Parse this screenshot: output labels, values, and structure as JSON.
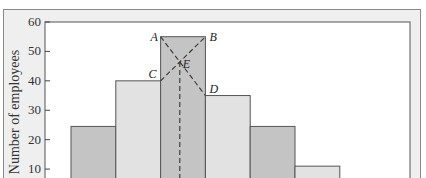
{
  "chart_data": {
    "type": "bar",
    "title": "",
    "xlabel": "",
    "ylabel": "Number of employees",
    "ylim": [
      0,
      60
    ],
    "yticks": [
      10,
      20,
      30,
      40,
      50,
      60
    ],
    "categories": [
      "class 1",
      "class 2",
      "class 3 (modal)",
      "class 4",
      "class 5",
      "class 6"
    ],
    "values": [
      24.5,
      40,
      55,
      35,
      24.5,
      11
    ],
    "bar_shades": [
      "dark",
      "light",
      "dark",
      "light",
      "dark",
      "light"
    ],
    "annotations": {
      "points": [
        {
          "label": "A",
          "desc": "top-left corner of modal bar",
          "y": 55
        },
        {
          "label": "B",
          "desc": "top-right corner of modal bar",
          "y": 55
        },
        {
          "label": "C",
          "desc": "top-right corner of preceding bar",
          "y": 40
        },
        {
          "label": "D",
          "desc": "top-left corner of following bar",
          "y": 35
        },
        {
          "label": "E",
          "desc": "intersection of lines AD and CB (mode estimate)",
          "y": 46.8
        }
      ],
      "lines": [
        "A–D dashed",
        "C–B dashed",
        "E vertical dashed to x-axis"
      ]
    },
    "grid": false,
    "legend": null
  },
  "colors": {
    "frame_bg": "#efefef",
    "frame_border": "#8a8a8a",
    "plot_bg": "#ffffff",
    "bar_dark": "#c4c4c4",
    "bar_light": "#e2e2e2",
    "bar_stroke": "#555555",
    "dash": "#333333"
  }
}
